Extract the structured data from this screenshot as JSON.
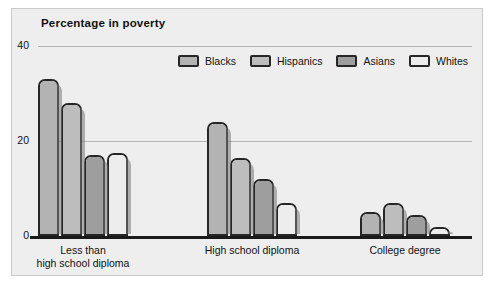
{
  "chart_data": {
    "type": "bar",
    "title": "Percentage in poverty",
    "xlabel": "",
    "ylabel": "",
    "ylim": [
      0,
      40
    ],
    "yticks": [
      0,
      20,
      40
    ],
    "ytick_labels": [
      "0",
      "20",
      "40"
    ],
    "grid": true,
    "legend_position": "top-right",
    "categories": [
      "Less than\nhigh school diploma",
      "High school diploma",
      "College degree"
    ],
    "series": [
      {
        "name": "Blacks",
        "color": "#b3b3b3",
        "values": [
          33,
          24,
          5
        ]
      },
      {
        "name": "Hispanics",
        "color": "#bdbdbd",
        "values": [
          28,
          16.5,
          7
        ]
      },
      {
        "name": "Asians",
        "color": "#9e9e9e",
        "values": [
          17,
          12,
          4.5
        ]
      },
      {
        "name": "Whites",
        "color": "#ededed",
        "values": [
          17.5,
          7,
          2
        ]
      }
    ]
  },
  "colors": {
    "panel_background": "#eeeeee",
    "panel_border": "#c9c9c9",
    "gridline": "#b3b3b3",
    "axis_line": "#1a1a1a",
    "bar_outline": "#262626",
    "text": "#111111"
  }
}
